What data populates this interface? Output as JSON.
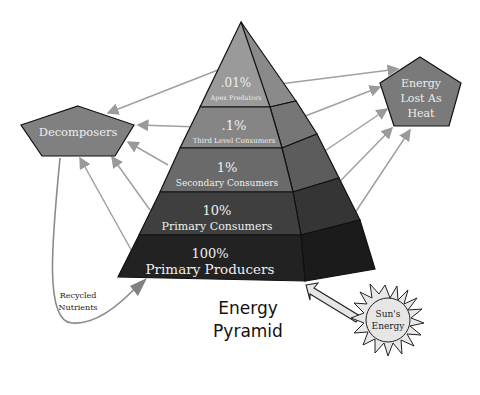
{
  "title": {
    "line1": "Energy",
    "line2": "Pyramid"
  },
  "levels": [
    {
      "percent": ".01%",
      "label": "Apex Predators",
      "color": "#9a9a9a",
      "side": "#8a8a8a"
    },
    {
      "percent": ".1%",
      "label": "Third Level Consumers",
      "color": "#858585",
      "side": "#767676"
    },
    {
      "percent": "1%",
      "label": "Secondary Consumers",
      "color": "#6a6a6a",
      "side": "#5c5c5c"
    },
    {
      "percent": "10%",
      "label": "Primary Consumers",
      "color": "#3f3f3f",
      "side": "#353535"
    },
    {
      "percent": "100%",
      "label": "Primary Producers",
      "color": "#222222",
      "side": "#1b1b1b"
    }
  ],
  "decomposers": {
    "label": "Decomposers",
    "color": "#808080"
  },
  "heat": {
    "line1": "Energy",
    "line2": "Lost As",
    "line3": "Heat",
    "color": "#7a7a7a"
  },
  "recycled": {
    "line1": "Recycled",
    "line2": "Nutrients"
  },
  "sun": {
    "line1": "Sun's",
    "line2": "Energy",
    "color": "#e6e6e6"
  },
  "colors": {
    "arrow": "#9a9a9a",
    "outline": "#111111"
  }
}
